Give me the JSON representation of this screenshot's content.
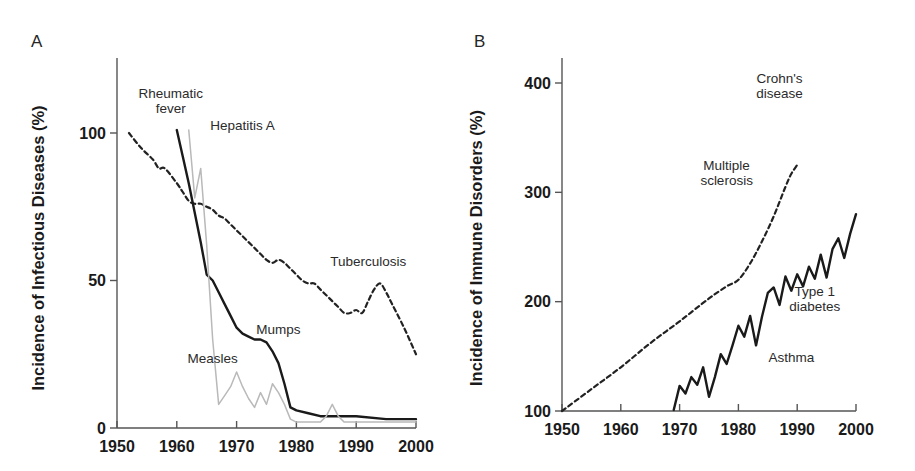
{
  "figure": {
    "background": "#ffffff",
    "panels": [
      {
        "letter": "A",
        "y_axis_title": "Incidence of Infectious Diseases (%)",
        "x_tick_labels": [
          "1950",
          "1960",
          "1970",
          "1980",
          "1990",
          "2000"
        ],
        "y_tick_labels": [
          "0",
          "50",
          "100"
        ],
        "series_labels": [
          {
            "name": "rheumatic-fever",
            "line1": "Rheumatic",
            "line2": "fever"
          },
          {
            "name": "hepatitis-a",
            "line1": "Hepatitis A",
            "line2": ""
          },
          {
            "name": "tuberculosis",
            "line1": "Tuberculosis",
            "line2": ""
          },
          {
            "name": "mumps",
            "line1": "Mumps",
            "line2": ""
          },
          {
            "name": "measles",
            "line1": "Measles",
            "line2": ""
          }
        ]
      },
      {
        "letter": "B",
        "y_axis_title": "Incidence of Immune Disorders (%)",
        "x_tick_labels": [
          "1950",
          "1960",
          "1970",
          "1980",
          "1990",
          "2000"
        ],
        "y_tick_labels": [
          "100",
          "200",
          "300",
          "400"
        ],
        "series_labels": [
          {
            "name": "crohns-disease",
            "line1": "Crohn's",
            "line2": "disease"
          },
          {
            "name": "multiple-sclerosis",
            "line1": "Multiple",
            "line2": "sclerosis"
          },
          {
            "name": "type-1-diabetes",
            "line1": "Type 1",
            "line2": "diabetes"
          },
          {
            "name": "asthma",
            "line1": "Asthma",
            "line2": ""
          }
        ]
      }
    ]
  },
  "chart_data": [
    {
      "type": "line",
      "panel": "A",
      "title": "Incidence of Infectious Diseases (%)",
      "xlabel": "",
      "ylabel": "Incidence of Infectious Diseases (%)",
      "xlim": [
        1950,
        2000
      ],
      "ylim": [
        0,
        115
      ],
      "xticks": [
        1950,
        1960,
        1970,
        1980,
        1990,
        2000
      ],
      "yticks": [
        0,
        50,
        100
      ],
      "grid": false,
      "legend": "inline-annotations",
      "series": [
        {
          "name": "Tuberculosis",
          "style": "dashed",
          "color": "#222222",
          "x": [
            1952,
            1954,
            1956,
            1957,
            1958,
            1960,
            1961,
            1962,
            1963,
            1964,
            1965,
            1966,
            1967,
            1968,
            1969,
            1970,
            1971,
            1972,
            1973,
            1974,
            1975,
            1976,
            1977,
            1978,
            1979,
            1980,
            1981,
            1982,
            1983,
            1984,
            1985,
            1986,
            1987,
            1988,
            1989,
            1990,
            1991,
            1992,
            1993,
            1994,
            1995,
            1996,
            1998,
            2000
          ],
          "y": [
            100,
            95,
            91,
            88,
            88,
            83,
            80,
            77,
            76,
            76,
            75,
            74,
            72,
            71,
            69,
            67,
            65,
            63,
            61,
            59,
            57,
            56,
            57,
            56,
            54,
            52,
            50,
            49,
            49,
            47,
            45,
            43,
            41,
            39,
            39,
            40,
            39,
            43,
            47,
            49,
            46,
            42,
            34,
            25
          ]
        },
        {
          "name": "Rheumatic fever / Mumps",
          "style": "solid",
          "color": "#1a1a1a",
          "x": [
            1960,
            1961,
            1962,
            1963,
            1964,
            1965,
            1966,
            1967,
            1968,
            1969,
            1970,
            1971,
            1972,
            1973,
            1974,
            1975,
            1976,
            1977,
            1978,
            1979,
            1980,
            1982,
            1984,
            1986,
            1988,
            1990,
            1995,
            2000
          ],
          "y": [
            101,
            92,
            83,
            73,
            63,
            52,
            50,
            46,
            42,
            38,
            34,
            32,
            31,
            30,
            30,
            29,
            26,
            22,
            15,
            7,
            6,
            5,
            4,
            4,
            4,
            4,
            3,
            3
          ]
        },
        {
          "name": "Measles",
          "style": "solid-light",
          "color": "#b9b9b9",
          "x": [
            1962,
            1963,
            1964,
            1965,
            1966,
            1967,
            1968,
            1969,
            1970,
            1971,
            1972,
            1973,
            1974,
            1975,
            1976,
            1977,
            1978,
            1979,
            1980,
            1982,
            1984,
            1985,
            1986,
            1987,
            1988,
            1990,
            1995,
            2000
          ],
          "y": [
            101,
            78,
            88,
            62,
            30,
            8,
            11,
            14,
            19,
            14,
            10,
            7,
            12,
            8,
            15,
            12,
            8,
            3,
            2,
            2,
            2,
            4,
            8,
            4,
            2,
            2,
            2,
            2
          ]
        }
      ],
      "annotations": [
        {
          "text": "Rheumatic fever",
          "x": 1959,
          "y": 112
        },
        {
          "text": "Hepatitis A",
          "x": 1971,
          "y": 101
        },
        {
          "text": "Tuberculosis",
          "x": 1992,
          "y": 55
        },
        {
          "text": "Mumps",
          "x": 1977,
          "y": 32
        },
        {
          "text": "Measles",
          "x": 1966,
          "y": 22
        }
      ]
    },
    {
      "type": "line",
      "panel": "B",
      "title": "Incidence of Immune Disorders (%)",
      "xlabel": "",
      "ylabel": "Incidence of Immune Disorders (%)",
      "xlim": [
        1950,
        2000
      ],
      "ylim": [
        100,
        425
      ],
      "xticks": [
        1950,
        1960,
        1970,
        1980,
        1990,
        2000
      ],
      "yticks": [
        100,
        200,
        300,
        400
      ],
      "grid": false,
      "legend": "inline-annotations",
      "series": [
        {
          "name": "Multiple sclerosis / Crohn's disease",
          "style": "dashed",
          "color": "#222222",
          "x": [
            1950,
            1955,
            1960,
            1965,
            1970,
            1975,
            1978,
            1980,
            1982,
            1984,
            1986,
            1988,
            1989,
            1990
          ],
          "y": [
            100,
            120,
            140,
            162,
            182,
            203,
            214,
            220,
            235,
            255,
            278,
            305,
            317,
            325
          ]
        },
        {
          "name": "Asthma / Type 1 diabetes",
          "style": "solid",
          "color": "#1a1a1a",
          "x": [
            1969,
            1970,
            1971,
            1972,
            1973,
            1974,
            1975,
            1976,
            1977,
            1978,
            1979,
            1980,
            1981,
            1982,
            1983,
            1984,
            1985,
            1986,
            1987,
            1988,
            1989,
            1990,
            1991,
            1992,
            1993,
            1994,
            1995,
            1996,
            1997,
            1998,
            1999,
            2000
          ],
          "y": [
            101,
            123,
            116,
            131,
            124,
            140,
            113,
            131,
            152,
            143,
            160,
            178,
            168,
            187,
            160,
            186,
            208,
            213,
            197,
            223,
            210,
            225,
            214,
            232,
            221,
            243,
            222,
            248,
            258,
            240,
            262,
            280
          ]
        }
      ],
      "annotations": [
        {
          "text": "Crohn's disease",
          "x": 1987,
          "y": 400
        },
        {
          "text": "Multiple sclerosis",
          "x": 1978,
          "y": 320
        },
        {
          "text": "Type 1 diabetes",
          "x": 1993,
          "y": 205
        },
        {
          "text": "Asthma",
          "x": 1989,
          "y": 145
        }
      ]
    }
  ]
}
